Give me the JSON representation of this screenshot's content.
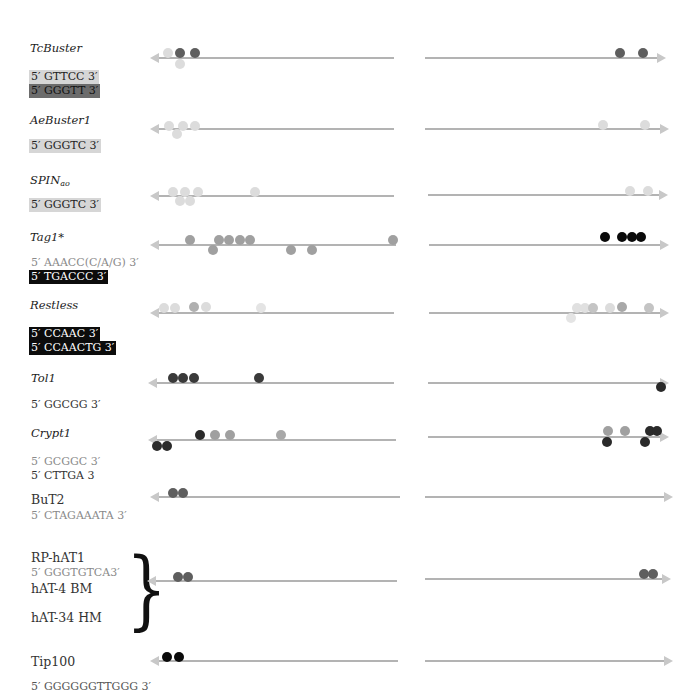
{
  "colors": {
    "track": "#b3b3b3",
    "arrow": "#c8c8c8",
    "dot_very_light": "#dcdcdc",
    "dot_light": "#c4c4c4",
    "dot_mid": "#a0a0a0",
    "dot_dark": "#5e5e5e",
    "dot_very_dark": "#2a2a2a",
    "dot_black": "#0a0a0a"
  },
  "elements": [
    {
      "name": "TcBuster",
      "style": "italic",
      "motifs": [
        {
          "text": "5′ GTTCC 3′",
          "style": "light"
        },
        {
          "text": "5′ GGGTT 3′",
          "style": "mid"
        }
      ]
    },
    {
      "name": "AeBuster1",
      "style": "italic",
      "motifs": [
        {
          "text": "5′ GGGTC 3′",
          "style": "light"
        }
      ]
    },
    {
      "name": "SPIN",
      "name_sub": "ao",
      "style": "italic",
      "motifs": [
        {
          "text": "5′ GGGTC 3′",
          "style": "light"
        }
      ]
    },
    {
      "name": "Tag1*",
      "style": "italic",
      "motifs": [
        {
          "text": "5′ AAACC(C/A/G) 3′",
          "style": "gray-text"
        },
        {
          "text": "5′ TGACCC 3′",
          "style": "dark"
        }
      ]
    },
    {
      "name": "Restless",
      "style": "italic",
      "motifs": [
        {
          "text": "5′ CCAAC 3′",
          "style": "dark"
        },
        {
          "text": "5′ CCAACTG 3′",
          "style": "dark"
        }
      ]
    },
    {
      "name": "Tol1",
      "style": "italic",
      "motifs": [
        {
          "text": "5′ GGCGG 3′",
          "style": "plain"
        }
      ]
    },
    {
      "name": "Crypt1",
      "style": "italic",
      "motifs": [
        {
          "text": "5′ GCGGC 3′",
          "style": "gray-text"
        },
        {
          "text": "5′ CTTGA 3",
          "style": "plain"
        }
      ]
    },
    {
      "name": "BuT2",
      "style": "upright",
      "motifs": [
        {
          "text": "5′ CTAGAAATA 3′",
          "style": "gray-text"
        }
      ]
    },
    {
      "name": "RP-hAT1",
      "style": "upright",
      "group_members": [
        "RP-hAT1",
        "hAT-4 BM",
        "hAT-34 HM"
      ],
      "motifs": [
        {
          "text": "5′ GGGTGTCA3′",
          "style": "gray-text"
        }
      ]
    },
    {
      "name": "Tip100",
      "style": "upright",
      "motifs": [
        {
          "text": "5′ GGGGGGTTGGG 3′",
          "style": "plain-cut"
        }
      ]
    }
  ],
  "labels": {
    "tcbuster": "TcBuster",
    "tcbuster_m1": "5′ GTTCC 3′",
    "tcbuster_m2": "5′ GGGTT 3′",
    "aebuster": "AeBuster1",
    "aebuster_m1": "5′ GGGTC 3′",
    "spin": "SPIN",
    "spin_sub": "ao",
    "spin_m1": "5′ GGGTC 3′",
    "tag1": "Tag1*",
    "tag1_m1": "5′ AAACC(C/A/G) 3′",
    "tag1_m2": "5′ TGACCC 3′",
    "restless": "Restless",
    "restless_m1": "5′ CCAAC 3′",
    "restless_m2": "5′ CCAACTG 3′",
    "tol1": "Tol1",
    "tol1_m1": "5′ GGCGG 3′",
    "crypt1": "Crypt1",
    "crypt1_m1": "5′ GCGGC 3′",
    "crypt1_m2": "5′ CTTGA 3",
    "but2": "BuT2",
    "but2_m1": "5′ CTAGAAATA 3′",
    "rphat1": "RP-hAT1",
    "rphat1_m1": "5′ GGGTGTCA3′",
    "hat4": "hAT-4 BM",
    "hat34": "hAT-34 HM",
    "tip100": "Tip100",
    "tip100_m1": "5′ GGGGGGTTGGG 3′",
    "brace": "}"
  }
}
